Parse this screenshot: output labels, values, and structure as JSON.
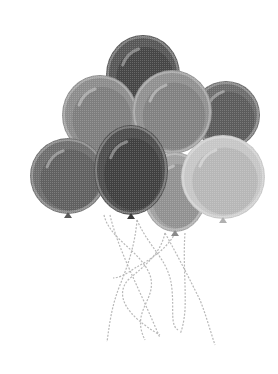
{
  "image": {
    "subject": "bunch of balloons with strings",
    "style": "grayscale halftone clip-art",
    "background": "#ffffff",
    "balloon_count": 8
  },
  "balloons": [
    {
      "id": "top",
      "cx": 143,
      "cy": 75,
      "rx": 37,
      "ry": 40,
      "fill": "#575757",
      "shade": "#3e3e3e"
    },
    {
      "id": "far-right-top",
      "cx": 226,
      "cy": 115,
      "rx": 34,
      "ry": 34,
      "fill": "#6c6c6c",
      "shade": "#555555"
    },
    {
      "id": "upper-left",
      "cx": 100,
      "cy": 115,
      "rx": 38,
      "ry": 40,
      "fill": "#8c8c8c",
      "shade": "#777777"
    },
    {
      "id": "upper-mid-right",
      "cx": 172,
      "cy": 112,
      "rx": 40,
      "ry": 42,
      "fill": "#909090",
      "shade": "#7a7a7a"
    },
    {
      "id": "left-lower",
      "cx": 68,
      "cy": 176,
      "rx": 38,
      "ry": 38,
      "fill": "#6e6e6e",
      "shade": "#5a5a5a"
    },
    {
      "id": "right-center",
      "cx": 175,
      "cy": 192,
      "rx": 32,
      "ry": 40,
      "fill": "#a0a0a0",
      "shade": "#8a8a8a"
    },
    {
      "id": "far-right-lower",
      "cx": 223,
      "cy": 177,
      "rx": 42,
      "ry": 42,
      "fill": "#c6c6c6",
      "shade": "#b0b0b0"
    },
    {
      "id": "center-front",
      "cx": 131,
      "cy": 170,
      "rx": 37,
      "ry": 45,
      "fill": "#4d4d4d",
      "shade": "#3a3a3a"
    }
  ],
  "strings_color": "#b8b8b8"
}
